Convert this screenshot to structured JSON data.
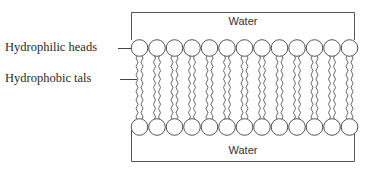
{
  "diagram": {
    "labels": {
      "heads": "Hydrophilic heads",
      "tails": "Hydrophobic tals"
    },
    "regions": {
      "top_water": "Water",
      "bottom_water": "Water"
    },
    "structure": {
      "lipids_per_leaflet": 13,
      "leaflets": 2,
      "tails_per_lipid": 2
    },
    "colors": {
      "stroke": "#555555",
      "text": "#2a2a2a",
      "background": "#ffffff"
    }
  }
}
